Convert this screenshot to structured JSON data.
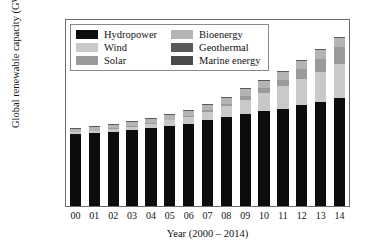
{
  "chart_data": {
    "type": "bar",
    "subtype": "stacked-vertical",
    "title": "",
    "xlabel": "Year (2000 – 2014)",
    "ylabel": "Global renewable capacity (GW)",
    "categories": [
      "00",
      "01",
      "02",
      "03",
      "04",
      "05",
      "06",
      "07",
      "08",
      "09",
      "10",
      "11",
      "12",
      "13",
      "14"
    ],
    "category_full_years": [
      2000,
      2001,
      2002,
      2003,
      2004,
      2005,
      2006,
      2007,
      2008,
      2009,
      2010,
      2011,
      2012,
      2013,
      2014
    ],
    "ylim": [
      0,
      2000
    ],
    "yticks": [
      0,
      400,
      800,
      1200,
      1600,
      2000
    ],
    "xlim_note": "categorical",
    "grid": false,
    "legend_position": "upper-left-inside",
    "legend_columns": 2,
    "units": "GW",
    "series": [
      {
        "name": "Hydropower",
        "color": "#0d0d0d",
        "values": [
          775,
          785,
          800,
          815,
          838,
          862,
          880,
          920,
          952,
          985,
          1018,
          1048,
          1082,
          1120,
          1158
        ]
      },
      {
        "name": "Wind",
        "color": "#c9c9c9",
        "values": [
          18,
          24,
          31,
          40,
          48,
          59,
          74,
          94,
          121,
          159,
          198,
          238,
          283,
          319,
          370
        ]
      },
      {
        "name": "Solar",
        "color": "#9a9a9a",
        "values": [
          1,
          2,
          3,
          4,
          6,
          8,
          11,
          16,
          23,
          40,
          52,
          72,
          104,
          140,
          180
        ]
      },
      {
        "name": "Bioenergy",
        "color": "#b4b4b4",
        "values": [
          36,
          38,
          41,
          44,
          48,
          52,
          56,
          60,
          65,
          70,
          76,
          82,
          88,
          94,
          100
        ]
      },
      {
        "name": "Geothermal",
        "color": "#5a5a5a",
        "values": [
          8,
          8,
          9,
          9,
          9,
          10,
          10,
          10,
          11,
          11,
          11,
          11,
          12,
          12,
          12
        ]
      },
      {
        "name": "Marine energy",
        "color": "#4a4a4a",
        "values": [
          1,
          1,
          1,
          1,
          1,
          1,
          1,
          1,
          1,
          1,
          1,
          1,
          1,
          1,
          1
        ]
      }
    ],
    "totals": [
      839,
      858,
      885,
      913,
      950,
      992,
      1032,
      1101,
      1173,
      1266,
      1356,
      1452,
      1570,
      1686,
      1821
    ]
  },
  "legend": {
    "entries": [
      {
        "label": "Hydropower",
        "swatch": "#0d0d0d"
      },
      {
        "label": "Bioenergy",
        "swatch": "#b4b4b4"
      },
      {
        "label": "Wind",
        "swatch": "#c9c9c9"
      },
      {
        "label": "Geothermal",
        "swatch": "#5a5a5a"
      },
      {
        "label": "Solar",
        "swatch": "#9a9a9a"
      },
      {
        "label": "Marine energy",
        "swatch": "#4a4a4a"
      }
    ]
  },
  "axes": {
    "y_title": "Global renewable capacity (GW)",
    "x_title": "Year (2000 – 2014)",
    "y_tick_labels": [
      "0",
      "400",
      "800",
      "1200",
      "1600",
      "2000"
    ],
    "x_tick_labels": [
      "00",
      "01",
      "02",
      "03",
      "04",
      "05",
      "06",
      "07",
      "08",
      "09",
      "10",
      "11",
      "12",
      "13",
      "14"
    ]
  },
  "style": {
    "frame_color": "#6b6b6b",
    "text_color": "#111111",
    "background": "#ffffff"
  }
}
